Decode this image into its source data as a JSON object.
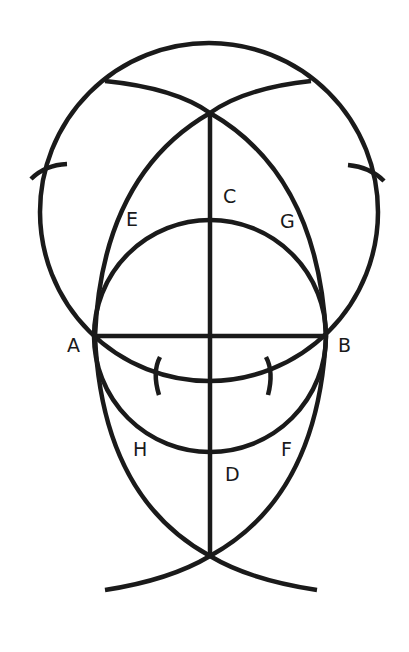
{
  "diagram": {
    "title": "",
    "colors": {
      "stroke": "#1a1a1a",
      "background": "#ffffff"
    },
    "labels": {
      "A": "A",
      "B": "B",
      "C": "C",
      "D": "D",
      "E": "E",
      "F": "F",
      "G": "G",
      "H": "H"
    },
    "points": {
      "A": [
        95,
        336
      ],
      "B": [
        326,
        336
      ],
      "C_apex_top": [
        210,
        113
      ],
      "D_apex_bottom": [
        210,
        556
      ],
      "big_circle_center": [
        209,
        212
      ],
      "small_circle_center": [
        210,
        336
      ]
    }
  }
}
